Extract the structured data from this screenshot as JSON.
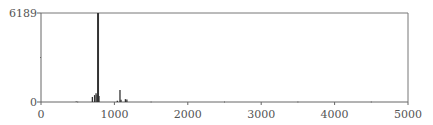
{
  "chart_data": {
    "type": "bar",
    "title": "",
    "xlabel": "",
    "ylabel": "",
    "xlim": [
      0,
      5000
    ],
    "ylim": [
      0,
      6189
    ],
    "x_ticks": [
      0,
      1000,
      2000,
      3000,
      4000,
      5000
    ],
    "x_tick_labels": [
      "0",
      "1000",
      "2000",
      "3000",
      "4000",
      "5000"
    ],
    "y_tick_labels": [
      "0",
      "6189"
    ],
    "grid": false,
    "legend": null,
    "peaks": [
      {
        "x": 480,
        "y": 40
      },
      {
        "x": 700,
        "y": 350
      },
      {
        "x": 730,
        "y": 480
      },
      {
        "x": 750,
        "y": 600
      },
      {
        "x": 765,
        "y": 500
      },
      {
        "x": 777,
        "y": 6189
      },
      {
        "x": 790,
        "y": 420
      },
      {
        "x": 1040,
        "y": 80
      },
      {
        "x": 1076,
        "y": 830
      },
      {
        "x": 1090,
        "y": 150
      },
      {
        "x": 1150,
        "y": 200
      },
      {
        "x": 1170,
        "y": 180
      }
    ]
  },
  "axes": {
    "y_max_label": "6189",
    "y_min_label": "0"
  },
  "colors": {
    "line": "#333333",
    "axis": "#666666",
    "text": "#555555"
  }
}
